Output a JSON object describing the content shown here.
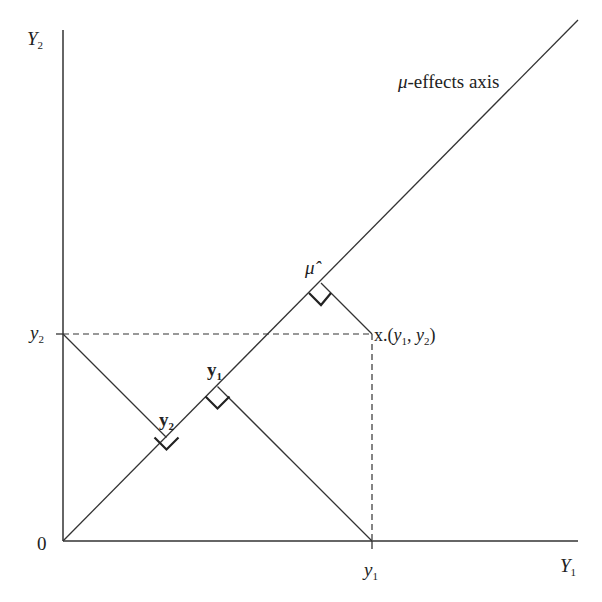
{
  "diagram": {
    "type": "geometric-projection",
    "axes": {
      "x_axis_label": "Y",
      "x_axis_sub": "1",
      "y_axis_label": "Y",
      "y_axis_sub": "2",
      "origin_label": "0"
    },
    "ticks": {
      "x_tick_label": "y",
      "x_tick_sub": "1",
      "y_tick_label": "y",
      "y_tick_sub": "2"
    },
    "diagonal_label": "μ-effects axis",
    "diagonal_label_mu": "μ",
    "diagonal_label_rest": "-effects axis",
    "point_label": {
      "prefix": "x.(",
      "a": "y",
      "a_sub": "1",
      "sep": ", ",
      "b": "y",
      "b_sub": "2",
      "suffix": ")"
    },
    "projections": [
      {
        "name": "mu-hat",
        "label": "μ̂"
      },
      {
        "name": "y1-projection",
        "label": "y",
        "sub": "1"
      },
      {
        "name": "y2-projection",
        "label": "y",
        "sub": "2"
      }
    ],
    "colors": {
      "line": "#333333",
      "background": "#ffffff"
    },
    "coordinates_px": {
      "origin": [
        63,
        541
      ],
      "point_x": [
        372,
        334
      ],
      "mu_hat_foot": [
        321,
        283
      ],
      "y1_foot": [
        217.5,
        386.5
      ],
      "y2_foot": [
        166.5,
        437.5
      ]
    }
  }
}
